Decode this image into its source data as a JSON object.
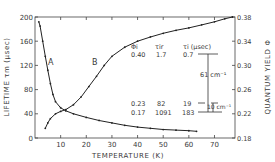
{
  "chart_data": {
    "type": "line",
    "title": "",
    "xlabel": "TEMPERATURE (K)",
    "ylabel": "LIFETIME τm (μsec)",
    "ylabel_right": "QUANTUM YIELD Φ",
    "xlim": [
      0,
      78
    ],
    "ylim": [
      0,
      200
    ],
    "ylim_right": [
      0.18,
      0.38
    ],
    "x_ticks": [
      "10",
      "20",
      "30",
      "40",
      "50",
      "60",
      "70"
    ],
    "y_ticks": [
      "0",
      "40",
      "80",
      "120",
      "160",
      "200"
    ],
    "y_ticks_right": [
      "0.18",
      "0.22",
      "0.26",
      "0.30",
      "0.34",
      "0.38"
    ],
    "grid": false,
    "series": [
      {
        "name": "A",
        "axis": "left",
        "label": "A",
        "x": [
          1.5,
          2,
          3,
          4,
          5,
          6,
          7,
          8,
          10,
          12,
          15,
          20,
          25,
          30,
          35,
          40,
          45,
          50,
          55,
          60,
          63
        ],
        "y": [
          192,
          185,
          160,
          135,
          112,
          90,
          72,
          60,
          50,
          45,
          40,
          34,
          29,
          25,
          21,
          18,
          16,
          14,
          13,
          12,
          11
        ]
      },
      {
        "name": "B",
        "axis": "right",
        "label": "B",
        "x": [
          4,
          5,
          6,
          8,
          10,
          12,
          15,
          18,
          21,
          24,
          27,
          30,
          35,
          40,
          45,
          50,
          55,
          60,
          65,
          70,
          74,
          77
        ],
        "y": [
          0.196,
          0.205,
          0.212,
          0.22,
          0.224,
          0.227,
          0.235,
          0.248,
          0.265,
          0.282,
          0.3,
          0.315,
          0.33,
          0.34,
          0.347,
          0.353,
          0.358,
          0.362,
          0.367,
          0.372,
          0.377,
          0.38
        ]
      }
    ],
    "annotations": {
      "table_headers": [
        "Φi",
        "τir",
        "τi (μsec)"
      ],
      "table_rows": [
        [
          "0.40",
          "1.7",
          "0.7"
        ],
        [
          "0.23",
          "82",
          "19"
        ],
        [
          "0.17",
          "1091",
          "183"
        ]
      ],
      "energy_labels": [
        "61 cm⁻¹",
        "10 cm⁻¹"
      ]
    }
  }
}
